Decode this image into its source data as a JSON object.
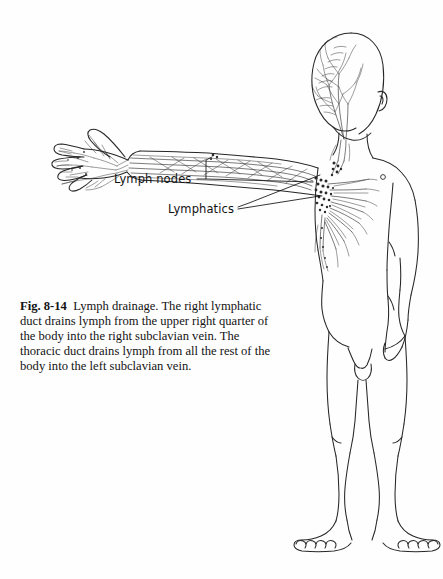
{
  "figure": {
    "number": "Fig. 8-14",
    "caption_body": "Lymph drainage. The right lymphatic duct drains lymph from the upper right quarter of the body into the right subclavian vein. The thoracic duct drains lymph from all the rest of the body into the left subclavian vein.",
    "view": "anterior full body, left arm outstretched"
  },
  "labels": {
    "lymph_nodes": "Lymph nodes",
    "lymphatics": "Lymphatics"
  },
  "colors": {
    "background": "#fefefe",
    "ink": "#1a1a1a",
    "vessel": "#2b2b2b",
    "node": "#2a2a2a",
    "text": "#131313"
  }
}
